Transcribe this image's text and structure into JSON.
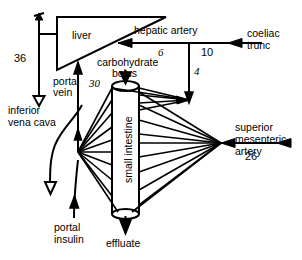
{
  "diagram": {
    "organs": {
      "liver": "liver",
      "small_intestine": "small intestine"
    },
    "labels": {
      "hepatic_artery": "hepatic artery",
      "coeliac_trunc_line1": "coeliac",
      "coeliac_trunc_line2": "trunc",
      "carbohydrate_bolus_line1": "carbohydrate",
      "carbohydrate_bolus_line2": "bolus",
      "portal_vein_line1": "portal",
      "portal_vein_line2": "vein",
      "inferior_vena_cava_line1": "inferior",
      "inferior_vena_cava_line2": "vena cava",
      "portal_insulin_line1": "portal",
      "portal_insulin_line2": "insulin",
      "superior_mesenteric_artery_line1": "superior",
      "superior_mesenteric_artery_line2": "mesenteric",
      "superior_mesenteric_artery_line3": "artery",
      "effluate": "effluate"
    },
    "flows": {
      "inferior_vena_cava_flow": "36",
      "hepatic_artery_flow": "6",
      "coeliac_trunc_flow": "10",
      "gastric_branch_flow": "4",
      "portal_vein_flow": "30",
      "superior_mesenteric_artery_flow": "26"
    },
    "colors": {
      "stroke": "#000000",
      "background": "#ffffff"
    }
  }
}
